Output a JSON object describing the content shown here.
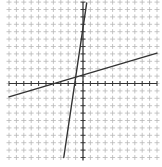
{
  "chart_data": {
    "type": "line",
    "title": "",
    "xlabel": "",
    "ylabel": "",
    "xlim": [
      -10,
      10
    ],
    "ylim": [
      -10,
      11
    ],
    "grid": true,
    "grid_style": "tick-marks",
    "grid_color": "#b8b8b8",
    "axis_color": "#333333",
    "series": [
      {
        "name": "line-1-shallow",
        "color": "#333333",
        "points": [
          [
            -10,
            -1.8
          ],
          [
            10,
            4.1
          ]
        ],
        "slope": 0.3,
        "intercept": 1.1
      },
      {
        "name": "line-2-steep",
        "color": "#333333",
        "points": [
          [
            -2.6,
            -10
          ],
          [
            0.5,
            10.9
          ]
        ],
        "slope": 6.7,
        "intercept": 7.5
      }
    ]
  },
  "layout": {
    "origin_px": [
      83,
      83.5
    ],
    "unit_px": 7.4
  }
}
